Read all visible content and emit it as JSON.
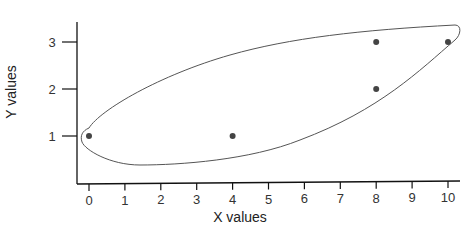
{
  "chart_data": {
    "type": "scatter",
    "title": "",
    "xlabel": "X values",
    "ylabel": "Y values",
    "xlim": [
      0,
      10
    ],
    "ylim": [
      0,
      3
    ],
    "x_ticks": [
      "0",
      "1",
      "2",
      "3",
      "4",
      "5",
      "6",
      "7",
      "8",
      "9",
      "10"
    ],
    "y_ticks": [
      "1",
      "2",
      "3"
    ],
    "grid": false,
    "points": [
      {
        "x": 0,
        "y": 1
      },
      {
        "x": 4,
        "y": 1
      },
      {
        "x": 8,
        "y": 3
      },
      {
        "x": 8,
        "y": 2
      },
      {
        "x": 10,
        "y": 3
      }
    ],
    "annotations": [
      "Hand-drawn enclosing loop around all points"
    ],
    "colors": {
      "point": "#444444",
      "loop": "#555555",
      "axis": "#111111"
    }
  },
  "labels": {
    "x_axis": "X values",
    "y_axis": "Y values",
    "x_ticks": [
      "0",
      "1",
      "2",
      "3",
      "4",
      "5",
      "6",
      "7",
      "8",
      "9",
      "10"
    ],
    "y_ticks": [
      "1",
      "2",
      "3"
    ]
  }
}
